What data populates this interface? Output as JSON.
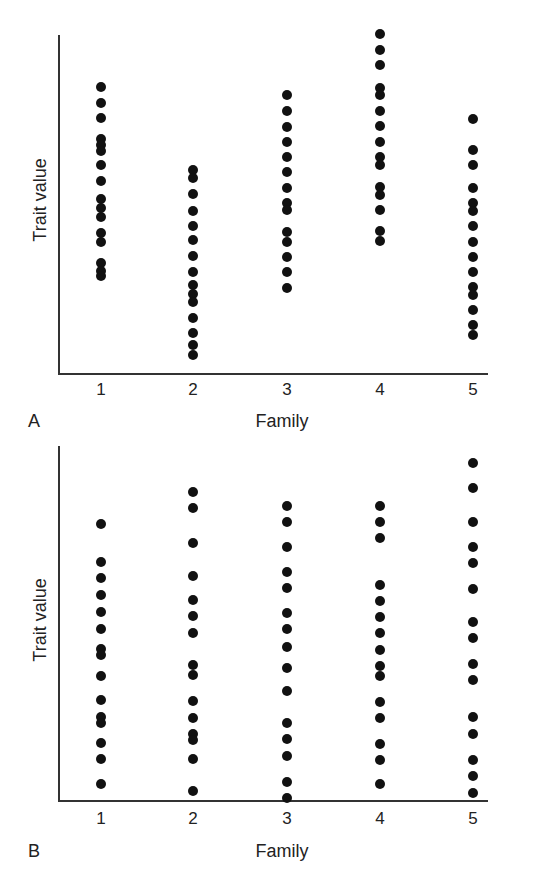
{
  "chart_data": [
    {
      "type": "scatter",
      "panel": "A",
      "title": "",
      "xlabel": "Family",
      "ylabel": "Trait value",
      "categories": [
        "1",
        "2",
        "3",
        "4",
        "5"
      ],
      "ylim": [
        0,
        100
      ],
      "grid": false,
      "legend": null,
      "series": [
        {
          "name": "Family 1",
          "x": 1,
          "values": [
            84.6,
            79.9,
            75.4,
            69.2,
            67.5,
            65.7,
            61.5,
            56.8,
            51.5,
            48.8,
            46.2,
            41.4,
            38.8,
            32.5,
            30.2,
            28.7
          ]
        },
        {
          "name": "Family 2",
          "x": 2,
          "values": [
            60.1,
            57.7,
            53.0,
            47.9,
            43.5,
            39.3,
            34.6,
            29.9,
            26.0,
            23.4,
            21.0,
            16.3,
            11.8,
            8.3,
            5.3
          ]
        },
        {
          "name": "Family 3",
          "x": 3,
          "values": [
            82.2,
            77.5,
            72.8,
            68.3,
            63.9,
            59.5,
            54.7,
            50.3,
            48.2,
            41.7,
            38.8,
            34.3,
            29.9,
            25.1
          ]
        },
        {
          "name": "Family 4",
          "x": 4,
          "values": [
            100.3,
            95.6,
            91.1,
            84.3,
            82.2,
            77.5,
            73.1,
            68.3,
            63.9,
            61.5,
            55.0,
            52.7,
            48.2,
            42.0,
            39.1
          ]
        },
        {
          "name": "Family 5",
          "x": 5,
          "values": [
            75.1,
            65.9,
            61.5,
            54.7,
            50.3,
            47.9,
            43.5,
            38.8,
            34.3,
            29.9,
            25.4,
            23.1,
            18.6,
            14.2,
            11.2
          ]
        }
      ]
    },
    {
      "type": "scatter",
      "panel": "B",
      "title": "",
      "xlabel": "Family",
      "ylabel": "Trait value",
      "categories": [
        "1",
        "2",
        "3",
        "4",
        "5"
      ],
      "ylim": [
        0,
        100
      ],
      "grid": false,
      "legend": null,
      "series": [
        {
          "name": "Family 1",
          "x": 1,
          "values": [
            82.1,
            71.1,
            66.4,
            61.4,
            56.7,
            51.7,
            45.8,
            44.0,
            37.9,
            31.0,
            26.0,
            24.2,
            18.5,
            13.8,
            6.3
          ]
        },
        {
          "name": "Family 2",
          "x": 2,
          "values": [
            91.5,
            86.8,
            76.8,
            67.0,
            60.1,
            55.4,
            50.4,
            41.1,
            38.3,
            30.7,
            25.7,
            21.0,
            19.1,
            13.8,
            4.4
          ]
        },
        {
          "name": "Family 3",
          "x": 3,
          "values": [
            87.4,
            82.7,
            75.4,
            68.3,
            63.6,
            56.2,
            51.5,
            46.5,
            40.2,
            33.6,
            24.2,
            19.5,
            14.5,
            7.1,
            2.4
          ]
        },
        {
          "name": "Family 4",
          "x": 4,
          "values": [
            87.4,
            82.7,
            78.0,
            64.5,
            59.8,
            55.1,
            50.4,
            45.4,
            40.7,
            38.0,
            30.4,
            25.7,
            18.2,
            13.5,
            6.3
          ]
        },
        {
          "name": "Family 5",
          "x": 5,
          "values": [
            100.0,
            92.7,
            82.7,
            75.4,
            70.7,
            63.3,
            53.6,
            48.9,
            41.4,
            36.7,
            26.0,
            21.0,
            13.5,
            8.8,
            3.8
          ]
        }
      ]
    }
  ],
  "panels": [
    {
      "letter": "A",
      "xlabel": "Family",
      "ylabel": "Trait value",
      "ticks": [
        "1",
        "2",
        "3",
        "4",
        "5"
      ]
    },
    {
      "letter": "B",
      "xlabel": "Family",
      "ylabel": "Trait value",
      "ticks": [
        "1",
        "2",
        "3",
        "4",
        "5"
      ]
    }
  ],
  "colors": {
    "dot": "#111111",
    "axis": "#333333",
    "text": "#222222",
    "background": "#ffffff"
  }
}
